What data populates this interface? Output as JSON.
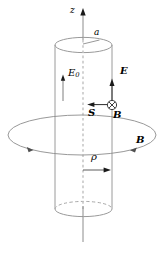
{
  "figure": {
    "type": "physics-vector-diagram",
    "width": 164,
    "height": 258,
    "background_color": "#ffffff"
  },
  "colors": {
    "cylinder_outline": "#9a9a9a",
    "field_loop": "#8c8c8c",
    "center_axis_dashed": "#b8b8b8",
    "axis_line": "#8c8c8c",
    "vector_arrow": "#1a1a1a",
    "label_text": "#000000"
  },
  "labels": {
    "z_axis": "z",
    "radius": "a",
    "applied_field": "E",
    "applied_field_sub": "0",
    "electric_field": "E",
    "poynting_vector": "S",
    "magnetic_field_into_page": "B",
    "magnetic_field_loop": "B",
    "radial_coordinate": "ρ"
  },
  "elements": {
    "z_axis": {
      "name": "vertical z axis",
      "direction": "up",
      "x": 83,
      "top_y": 10,
      "bottom_y": 242
    },
    "cylinder": {
      "name": "cylinder",
      "left_x": 55,
      "right_x": 112,
      "top_center_y": 45,
      "bottom_center_y": 209,
      "rx": 28.5,
      "ry": 7.5,
      "top_ellipse_style": "solid",
      "bottom_back_style": "dashed",
      "bottom_front_style": "solid"
    },
    "field_loop": {
      "name": "azimuthal magnetic field loop",
      "center_x": 82,
      "center_y": 135,
      "rx": 74,
      "ry": 20,
      "arrow_positions": [
        "left",
        "right"
      ],
      "circulation": "counterclockwise-viewed-from-above"
    },
    "e0_arrow": {
      "name": "applied axial field arrow",
      "x": 63,
      "tail_y": 100,
      "head_y": 75,
      "direction": "up"
    },
    "e_arrow": {
      "name": "electric field arrow at surface",
      "x": 112,
      "tail_y": 105,
      "head_y": 79,
      "direction": "up"
    },
    "s_arrow": {
      "name": "poynting vector arrow",
      "y": 105,
      "tail_x": 112,
      "head_x": 89,
      "direction": "left"
    },
    "b_into_page": {
      "name": "magnetic field into page symbol",
      "x": 112,
      "y": 105,
      "radius": 4.6,
      "glyph": "circled-cross"
    },
    "rho_arrow": {
      "name": "radial coordinate arrow",
      "y": 170,
      "tail_x": 83,
      "head_x": 109,
      "direction": "right"
    },
    "radius_tick": {
      "name": "radius segment on top face",
      "from_x": 83,
      "from_y": 45,
      "to_x": 99,
      "to_y": 40
    }
  },
  "vectors": [
    {
      "symbol": "E",
      "subscript": "0",
      "label_x": 67,
      "label_y": 70,
      "style": "italic",
      "meaning": "applied electric field"
    },
    {
      "symbol": "E",
      "subscript": "",
      "label_x": 121,
      "label_y": 72,
      "style": "bold-italic",
      "meaning": "electric field"
    },
    {
      "symbol": "S",
      "subscript": "",
      "label_x": 90,
      "label_y": 112,
      "style": "bold-italic",
      "meaning": "Poynting vector"
    },
    {
      "symbol": "B",
      "subscript": "",
      "label_x": 114,
      "label_y": 114,
      "style": "bold-italic",
      "meaning": "magnetic field into page"
    },
    {
      "symbol": "B",
      "subscript": "",
      "label_x": 137,
      "label_y": 140,
      "style": "bold-italic",
      "meaning": "magnetic field loop"
    }
  ],
  "scalars": [
    {
      "symbol": "z",
      "label_x": 73,
      "label_y": 12,
      "style": "italic",
      "meaning": "axial coordinate"
    },
    {
      "symbol": "a",
      "label_x": 96,
      "label_y": 33,
      "style": "italic",
      "meaning": "cylinder radius"
    },
    {
      "symbol": "ρ",
      "label_x": 92,
      "label_y": 155,
      "style": "italic",
      "meaning": "radial coordinate"
    }
  ]
}
